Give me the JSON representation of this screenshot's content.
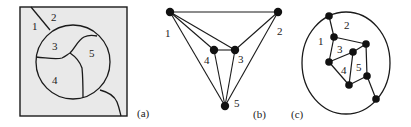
{
  "figure": {
    "panels": [
      {
        "id": "a",
        "caption": "(a)",
        "type": "map-regions",
        "regions": [
          {
            "label": "1"
          },
          {
            "label": "2"
          },
          {
            "label": "3"
          },
          {
            "label": "4"
          },
          {
            "label": "5"
          }
        ]
      },
      {
        "id": "b",
        "caption": "(b)",
        "type": "graph",
        "nodes": [
          {
            "label": "1"
          },
          {
            "label": "2"
          },
          {
            "label": "3"
          },
          {
            "label": "4"
          },
          {
            "label": "5"
          }
        ],
        "edges": [
          [
            "1",
            "2"
          ],
          [
            "1",
            "4"
          ],
          [
            "1",
            "3"
          ],
          [
            "1",
            "5"
          ],
          [
            "2",
            "3"
          ],
          [
            "2",
            "5"
          ],
          [
            "4",
            "3"
          ],
          [
            "4",
            "5"
          ],
          [
            "3",
            "5"
          ]
        ]
      },
      {
        "id": "c",
        "caption": "(c)",
        "type": "dual-graph-on-map",
        "faces": [
          {
            "label": "1"
          },
          {
            "label": "2"
          },
          {
            "label": "3"
          },
          {
            "label": "4"
          },
          {
            "label": "5"
          }
        ]
      }
    ],
    "colors": {
      "map_fill": "#e9e9e9",
      "line": "#1a1a1a",
      "background": "#ffffff"
    }
  }
}
